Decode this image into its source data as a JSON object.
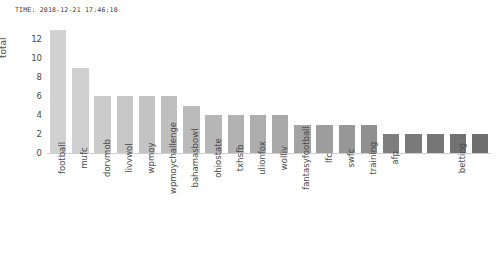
{
  "header": {
    "timestamp": "TIME: 2018-12-21 17:46:10"
  },
  "chart_data": {
    "type": "bar",
    "title": "",
    "xlabel": "",
    "ylabel": "total",
    "ylim": [
      0,
      13.6
    ],
    "yticks": [
      12,
      10,
      8,
      6,
      4,
      2,
      0
    ],
    "grid": false,
    "legend": null,
    "orientation": "vertical",
    "xtick_rotation": -90,
    "categories": [
      "football",
      "mufc",
      "dorvmob",
      "livvwol",
      "wpmoy",
      "wpmoychallenge",
      "bahamasbowl",
      "ohiostate",
      "txhsfb",
      "ulionfox",
      "wolliv",
      "fantasyfootball",
      "lfc",
      "swfc",
      "training",
      "afp",
      "",
      "",
      "betting",
      ""
    ],
    "values": [
      13,
      9,
      6,
      6,
      6,
      6,
      5,
      4,
      4,
      4,
      4,
      3,
      3,
      3,
      3,
      2,
      2,
      2,
      2,
      2
    ],
    "bar_colors": [
      "#d2d2d2",
      "#cfcfcf",
      "#cbcbcb",
      "#c7c7c7",
      "#c3c3c3",
      "#bfbfbf",
      "#bbbbbb",
      "#b6b6b6",
      "#b2b2b2",
      "#adadad",
      "#a8a8a8",
      "#a3a3a3",
      "#9d9d9d",
      "#979797",
      "#909090",
      "#7e7e7e",
      "#7a7a7a",
      "#767676",
      "#727272",
      "#6e6e6e"
    ]
  },
  "colors": {
    "background": "#ffffff",
    "text": "#4a4a4a",
    "axis": "#cfcfcf"
  }
}
